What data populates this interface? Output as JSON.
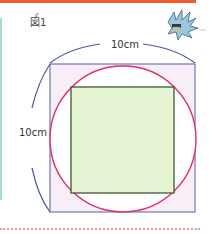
{
  "figure": {
    "label": "図1",
    "label_ruby": "ず",
    "width_label": "10cm",
    "height_label": "10cm"
  },
  "colors": {
    "top_bar": "#f15a2b",
    "left_strip": "#a8dcd1",
    "outer_square_stroke": "#6e78b4",
    "outer_square_fill": "#f7eef7",
    "circle_stroke": "#e0306a",
    "circle_fill": "#ffffff",
    "inner_square_stroke": "#2f4a2a",
    "inner_square_fill": "#e6f5d3",
    "dimension_arc": "#4a5aa0",
    "divider": "#e9a08f"
  },
  "decorations": {
    "mascot": "bird-mascot-icon"
  }
}
